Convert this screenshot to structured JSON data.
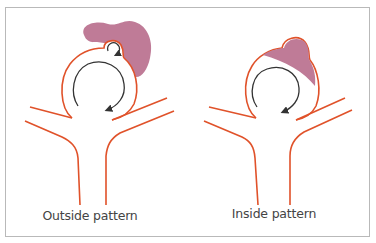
{
  "figure": {
    "panels": [
      {
        "id": "outside",
        "label": "Outside pattern",
        "center_x": 90
      },
      {
        "id": "inside",
        "label": "Inside pattern",
        "center_x": 274
      }
    ],
    "colors": {
      "vessel": "#e0522a",
      "sac_fill": "#bf7b97",
      "flow_arrow": "#333333",
      "frame": "#b9b9b9",
      "label": "#444444"
    }
  }
}
